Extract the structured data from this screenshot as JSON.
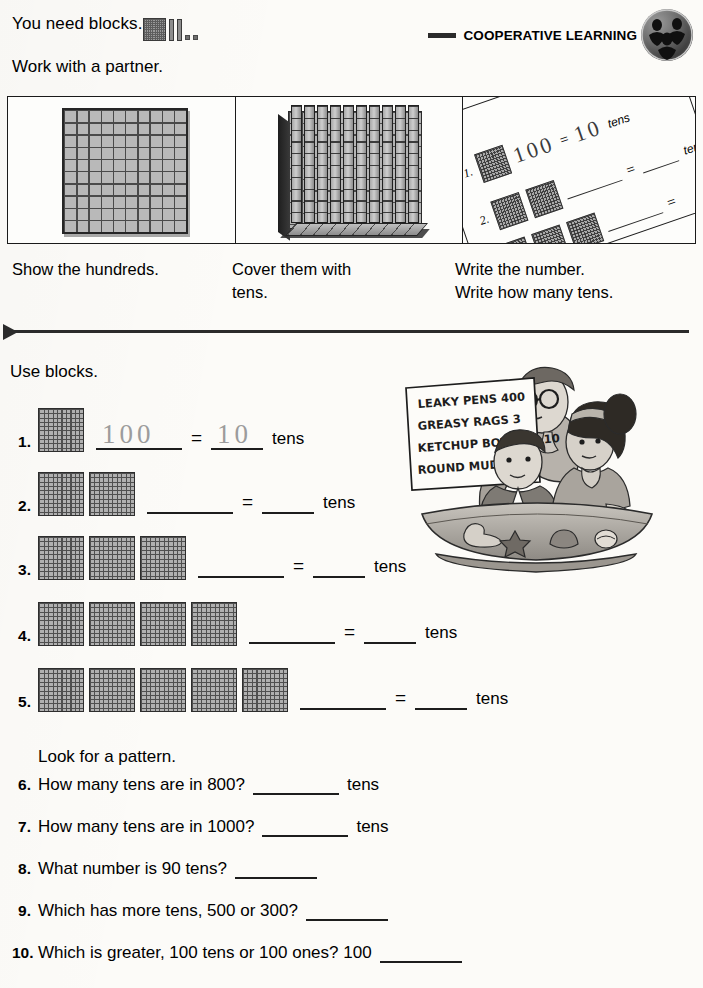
{
  "header": {
    "need_blocks_text": "You need blocks.",
    "blocks_icon": "base-ten-blocks-icon",
    "work_with_partner_text": "Work with a partner.",
    "banner_label": "COOPERATIVE LEARNING",
    "banner_badge_icon": "cooperative-learning-badge-icon"
  },
  "demo_panels": {
    "panels": [
      {
        "name": "hundreds-flat",
        "caption": "Show the hundreds."
      },
      {
        "name": "tens-cover",
        "caption": "Cover them with tens."
      },
      {
        "name": "write-number",
        "caption": "Write the number.\nWrite how many tens."
      }
    ],
    "caption1": "Show the hundreds.",
    "caption2_line1": "Cover them with",
    "caption2_line2": "tens.",
    "caption3_line1": "Write the number.",
    "caption3_line2": "Write how many tens.",
    "tilted_sheet": {
      "row1_number": "1.",
      "row2_number": "2.",
      "hand_value": "100",
      "hand_equals": "=",
      "hand_tens_value": "10",
      "tens_label_1": "tens",
      "tens_label_2": "tens",
      "equals_symbol": "="
    }
  },
  "main": {
    "use_blocks_text": "Use blocks.",
    "exercises": [
      {
        "number": "1.",
        "blocks": 1,
        "value": "100",
        "tens": "10",
        "equals": "=",
        "label": "tens",
        "prefilled": true
      },
      {
        "number": "2.",
        "blocks": 2,
        "value": "",
        "tens": "",
        "equals": "=",
        "label": "tens",
        "prefilled": false
      },
      {
        "number": "3.",
        "blocks": 3,
        "value": "",
        "tens": "",
        "equals": "=",
        "label": "tens",
        "prefilled": false
      },
      {
        "number": "4.",
        "blocks": 4,
        "value": "",
        "tens": "",
        "equals": "=",
        "label": "tens",
        "prefilled": false
      },
      {
        "number": "5.",
        "blocks": 5,
        "value": "",
        "tens": "",
        "equals": "=",
        "label": "tens",
        "prefilled": false
      }
    ],
    "look_for_pattern": "Look for a pattern.",
    "questions": [
      {
        "number": "6.",
        "text": "How many tens are in 800?",
        "tail": "tens"
      },
      {
        "number": "7.",
        "text": "How many tens are in 1000?",
        "tail": "tens"
      },
      {
        "number": "8.",
        "text": "What number is 90 tens?",
        "tail": ""
      },
      {
        "number": "9.",
        "text": "Which has more tens, 500 or 300?",
        "tail": ""
      },
      {
        "number": "10.",
        "text": "Which is greater, 100 tens or 100 ones? 100",
        "tail": ""
      }
    ]
  },
  "illustration": {
    "name": "three-students-with-sign-illustration",
    "sign_lines": [
      "LEAKY PENS 400",
      "GREASY RAGS 3",
      "KETCHUP BOTTLES 10",
      "ROUND MUD PIE"
    ]
  }
}
